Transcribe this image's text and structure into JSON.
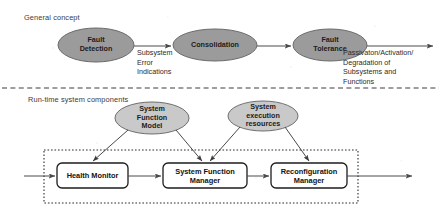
{
  "figure": {
    "sections": {
      "general_label": "General concept",
      "runtime_label": "Run-time system components"
    },
    "colors": {
      "ellipse_fill": "#9b9b9b",
      "ellipse_stroke": "#6e6e6e",
      "box_stroke": "#1c1c1c",
      "line": "#4a4a4a",
      "divider": "#3f3f3f",
      "container_stroke": "#2a2a2a",
      "background": "#ffffff",
      "text": "#1b1b1b"
    },
    "general_concept": {
      "nodes": [
        {
          "id": "fault-detection",
          "label": "Fault\nDetection",
          "shape": "ellipse",
          "cx": 96,
          "cy": 45,
          "rx": 38,
          "ry": 17
        },
        {
          "id": "consolidation",
          "label": "Consolidation",
          "shape": "ellipse",
          "cx": 215,
          "cy": 45,
          "rx": 42,
          "ry": 16
        },
        {
          "id": "fault-tolerance",
          "label": "Fault\nTolerance",
          "shape": "ellipse",
          "cx": 330,
          "cy": 45,
          "rx": 37,
          "ry": 16
        }
      ],
      "edges": [
        {
          "id": "edge-detection-consolidation",
          "from": "fault-detection",
          "to": "consolidation",
          "label": "Subsystem\nError\nIndications"
        },
        {
          "id": "edge-consolidation-tolerance",
          "from": "consolidation",
          "to": "fault-tolerance",
          "label": ""
        },
        {
          "id": "edge-tolerance-output",
          "from": "fault-tolerance",
          "to": "output",
          "label": "Passivaton/Activation/\nDegradation of\nSubsystems and\nFunctions"
        }
      ]
    },
    "runtime_components": {
      "inputs": [
        {
          "id": "system-function-model",
          "label": "System\nFunction\nModel",
          "shape": "ellipse",
          "cx": 152,
          "cy": 118,
          "rx": 37,
          "ry": 16
        },
        {
          "id": "system-execution-resources",
          "label": "System\nexecution\nresources",
          "shape": "ellipse",
          "cx": 263,
          "cy": 116,
          "rx": 35,
          "ry": 15
        }
      ],
      "container": {
        "id": "runtime-container",
        "style": "dotted",
        "x": 44,
        "y": 150,
        "width": 314,
        "height": 53
      },
      "blocks": [
        {
          "id": "health-monitor",
          "label": "Health Monitor",
          "x": 57,
          "y": 163,
          "width": 71,
          "height": 25
        },
        {
          "id": "system-function-manager",
          "label": "System Function\nManager",
          "x": 163,
          "y": 163,
          "width": 84,
          "height": 25
        },
        {
          "id": "reconfiguration-manager",
          "label": "Reconfiguration\nManager",
          "x": 271,
          "y": 163,
          "width": 76,
          "height": 25
        }
      ],
      "flow_edges": [
        {
          "id": "edge-in-health-monitor",
          "from": "external-input",
          "to": "health-monitor"
        },
        {
          "id": "edge-health-to-sfm",
          "from": "health-monitor",
          "to": "system-function-manager"
        },
        {
          "id": "edge-sfm-to-reconfig",
          "from": "system-function-manager",
          "to": "reconfiguration-manager"
        },
        {
          "id": "edge-reconfig-out",
          "from": "reconfiguration-manager",
          "to": "external-output"
        }
      ],
      "supply_edges": [
        {
          "id": "edge-sfmodel-to-health",
          "from": "system-function-model",
          "to": "health-monitor"
        },
        {
          "id": "edge-sfmodel-to-sfmanager",
          "from": "system-function-model",
          "to": "system-function-manager"
        },
        {
          "id": "edge-resources-to-sfmanager",
          "from": "system-execution-resources",
          "to": "system-function-manager"
        },
        {
          "id": "edge-resources-to-reconfig",
          "from": "system-execution-resources",
          "to": "reconfiguration-manager"
        }
      ]
    }
  }
}
